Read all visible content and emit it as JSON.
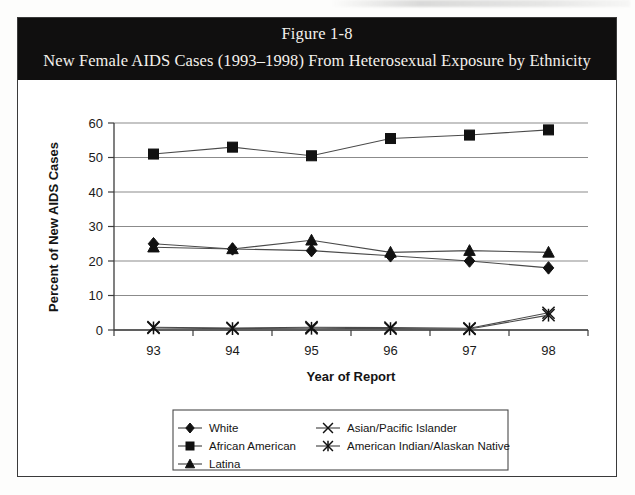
{
  "figure": {
    "title_line_1": "Figure 1-8",
    "title_line_2": "New Female AIDS Cases (1993–1998) From Heterosexual Exposure by Ethnicity"
  },
  "colors": {
    "banner_background": "#100f0f",
    "banner_text": "#f4f1ec",
    "frame": "#3a3a3a",
    "gridline": "#8b8b8b",
    "marker": "#111111",
    "page_background": "#ffffff"
  },
  "axes": {
    "y_tick_labels": [
      "0",
      "10",
      "20",
      "30",
      "40",
      "50",
      "60"
    ],
    "x_tick_labels": [
      "93",
      "94",
      "95",
      "96",
      "97",
      "98"
    ],
    "y_axis_title": "Percent of New AIDS Cases",
    "x_axis_title": "Year of Report"
  },
  "legend": {
    "entries": [
      {
        "label": "White",
        "marker": "diamond"
      },
      {
        "label": "African American",
        "marker": "square"
      },
      {
        "label": "Latina",
        "marker": "triangle"
      },
      {
        "label": "Asian/Pacific Islander",
        "marker": "x-cross"
      },
      {
        "label": "American Indian/Alaskan Native",
        "marker": "asterisk"
      }
    ]
  },
  "chart_data": {
    "type": "line",
    "title": "New Female AIDS Cases (1993–1998) From Heterosexual Exposure by Ethnicity",
    "subtitle": "Figure 1-8",
    "xlabel": "Year of Report",
    "ylabel": "Percent of New AIDS Cases",
    "categories": [
      "93",
      "94",
      "95",
      "96",
      "97",
      "98"
    ],
    "ylim": [
      0,
      60
    ],
    "ytick_step": 10,
    "grid": "horizontal",
    "legend_position": "bottom",
    "series": [
      {
        "name": "White",
        "marker": "diamond",
        "values": [
          25,
          23.5,
          23,
          21.5,
          20,
          18
        ]
      },
      {
        "name": "African American",
        "marker": "square",
        "values": [
          51,
          53,
          50.5,
          55.5,
          56.5,
          58
        ]
      },
      {
        "name": "Latina",
        "marker": "triangle",
        "values": [
          24,
          23.5,
          26,
          22.5,
          23,
          22.5
        ]
      },
      {
        "name": "Asian/Pacific Islander",
        "marker": "x-cross",
        "values": [
          0.8,
          0.6,
          0.8,
          0.7,
          0.5,
          5
        ]
      },
      {
        "name": "American Indian/Alaskan Native",
        "marker": "asterisk",
        "values": [
          0.6,
          0.4,
          0.5,
          0.4,
          0.3,
          4.3
        ]
      }
    ]
  }
}
